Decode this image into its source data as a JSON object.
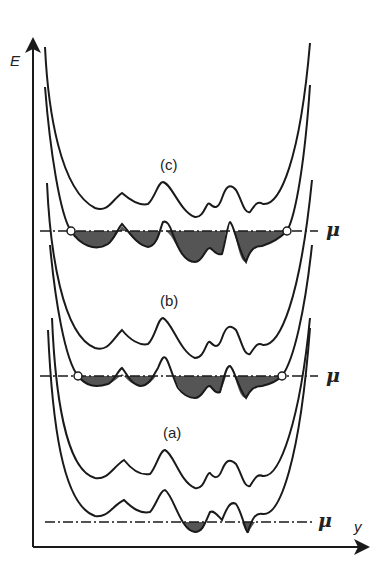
{
  "diagram": {
    "axes": {
      "y_axis_label": "E",
      "x_axis_label": "y"
    },
    "panels": [
      {
        "id": "c",
        "label": "(c)",
        "mu_label": "μ",
        "description": "Chemical potential above all barriers; electron sea filling the whole well between two open-circle contact points"
      },
      {
        "id": "b",
        "label": "(b)",
        "mu_label": "μ",
        "description": "Chemical potential intermediate; several filled puddles merged, two open-circle contact points"
      },
      {
        "id": "a",
        "label": "(a)",
        "mu_label": "μ",
        "description": "Chemical potential low; only two small isolated filled puddles at deepest minima"
      }
    ],
    "colors": {
      "line": "#1a1a1a",
      "fill": "#555555",
      "background": "#ffffff"
    }
  }
}
